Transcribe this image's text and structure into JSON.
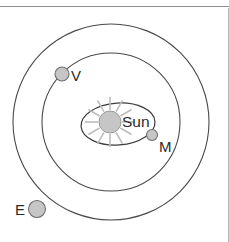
{
  "diagram": {
    "background_color": "#ffffff",
    "width": 229,
    "height": 242,
    "frame": {
      "top_rule": {
        "name": "top-horizontal-rule",
        "color": "#8c8c8c",
        "y": 6
      },
      "right_rule": {
        "name": "right-vertical-rule",
        "color": "#b6b6b6",
        "x": 228
      }
    },
    "sun": {
      "label": "Sun",
      "label_x": 122,
      "label_y": 127,
      "center_x": 110,
      "center_y": 122,
      "radius": 11,
      "fill_color": "#c6c6c6",
      "stroke_color": "#9a9a9a",
      "ray_color": "#bdbdbd",
      "ray_count": 12,
      "ray_inner_radius": 12,
      "ray_outer_radius": 25
    },
    "orbits": [
      {
        "name": "mercury-orbit",
        "shape": "ellipse",
        "center_x": 118,
        "center_y": 124,
        "radius_x": 37,
        "radius_y": 21,
        "rotation_deg": -4,
        "stroke_color": "#3c3c3c"
      },
      {
        "name": "venus-orbit",
        "shape": "circle",
        "center_x": 111,
        "center_y": 122,
        "radius": 69,
        "stroke_color": "#4a4a4a"
      },
      {
        "name": "earth-orbit",
        "shape": "circle",
        "center_x": 111,
        "center_y": 122,
        "radius": 98,
        "stroke_color": "#4a4a4a"
      }
    ],
    "planets": [
      {
        "name": "mercury",
        "label": "M",
        "center_x": 152,
        "center_y": 135,
        "radius": 5.5,
        "label_x": 159,
        "label_y": 152,
        "fill_color": "#c6c6c6",
        "stroke_color": "#6e6e6e"
      },
      {
        "name": "venus",
        "label": "V",
        "center_x": 62,
        "center_y": 74,
        "radius": 7,
        "label_x": 71,
        "label_y": 81,
        "fill_color": "#c6c6c6",
        "stroke_color": "#6e6e6e"
      },
      {
        "name": "earth",
        "label": "E",
        "center_x": 37,
        "center_y": 209,
        "radius": 8.5,
        "label_x": 15,
        "label_y": 215,
        "fill_color": "#c6c6c6",
        "stroke_color": "#6e6e6e"
      }
    ]
  }
}
